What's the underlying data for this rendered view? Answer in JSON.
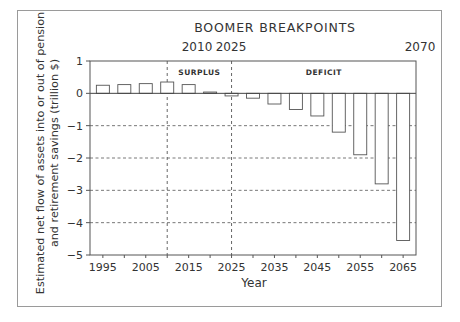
{
  "chart_data": {
    "type": "bar",
    "title": "BOOMER BREAKPOINTS",
    "xlabel": "Year",
    "ylabel": "Estimated net flow of assets into or out of pension and retirement savings (trillion $)",
    "ylabel_lines": [
      "Estimated net flow of assets into or out of pension",
      "and retirement savings (trillion $)"
    ],
    "categories": [
      1995,
      2000,
      2005,
      2010,
      2015,
      2020,
      2025,
      2030,
      2035,
      2040,
      2045,
      2050,
      2055,
      2060,
      2065
    ],
    "values": [
      0.25,
      0.27,
      0.3,
      0.35,
      0.27,
      0.04,
      -0.08,
      -0.15,
      -0.33,
      -0.5,
      -0.7,
      -1.2,
      -1.9,
      -2.8,
      -4.55
    ],
    "ylim": [
      -5,
      1
    ],
    "yticks": [
      1,
      0,
      -1,
      -2,
      -3,
      -4,
      -5
    ],
    "ytick_labels": [
      "1",
      "0",
      "−1",
      "−2",
      "−3",
      "−4",
      "−5"
    ],
    "xticks": [
      1995,
      2005,
      2015,
      2025,
      2035,
      2045,
      2055,
      2065
    ],
    "xlim": [
      1992,
      2068
    ],
    "grid": "horizontal dashed at -1,-2,-3,-4",
    "breakpoints": [
      {
        "year": 2010,
        "label": "2010",
        "line": "dashed"
      },
      {
        "year": 2025,
        "label": "2025",
        "line": "dashed"
      },
      {
        "year": 2070,
        "label": "2070",
        "line": "none"
      }
    ],
    "regions": [
      {
        "label": "SURPLUS",
        "from": 2010,
        "to": 2025
      },
      {
        "label": "DEFICIT",
        "from": 2025,
        "to": 2068
      }
    ],
    "legend": null
  }
}
